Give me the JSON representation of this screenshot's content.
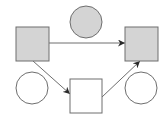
{
  "diagram": {
    "width": 167,
    "height": 117,
    "colors": {
      "background": "#ffffff",
      "gray_fill": "#d4d4d4",
      "white_fill": "#ffffff",
      "stroke": "#6e6e6e",
      "arrow": "#2a2a2a"
    },
    "nodes": [
      {
        "id": "square-left",
        "shape": "square",
        "fill": "gray",
        "x": 16,
        "y": 27,
        "w": 33,
        "h": 34
      },
      {
        "id": "circle-top",
        "shape": "circle",
        "fill": "gray",
        "cx": 86,
        "cy": 22,
        "r": 16
      },
      {
        "id": "square-right",
        "shape": "square",
        "fill": "gray",
        "x": 125,
        "y": 27,
        "w": 33,
        "h": 34
      },
      {
        "id": "circle-left",
        "shape": "circle",
        "fill": "white",
        "cx": 32,
        "cy": 88,
        "r": 16
      },
      {
        "id": "square-middle",
        "shape": "square",
        "fill": "white",
        "x": 70,
        "y": 79,
        "w": 32,
        "h": 34
      },
      {
        "id": "circle-right",
        "shape": "circle",
        "fill": "white",
        "cx": 141,
        "cy": 88,
        "r": 16
      }
    ],
    "edges": [
      {
        "from": "square-left",
        "to": "square-right",
        "x1": 49,
        "y1": 43,
        "x2": 125,
        "y2": 43
      },
      {
        "from": "square-left",
        "to": "square-middle",
        "x1": 33,
        "y1": 61,
        "x2": 70,
        "y2": 94
      },
      {
        "from": "square-middle",
        "to": "square-right",
        "x1": 102,
        "y1": 97,
        "x2": 140,
        "y2": 61
      }
    ]
  }
}
